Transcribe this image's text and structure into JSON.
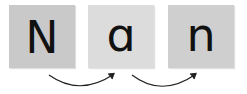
{
  "tiles": [
    {
      "letter": "N",
      "color": "#c9c9c9"
    },
    {
      "letter": "ɑ",
      "color": "#dcdcdc"
    },
    {
      "letter": "n",
      "color": "#cfcfcf"
    }
  ],
  "arrows": [
    {
      "from": "tile-1",
      "to": "tile-2"
    },
    {
      "from": "tile-2",
      "to": "tile-3"
    }
  ],
  "arrow_color": "#222222"
}
